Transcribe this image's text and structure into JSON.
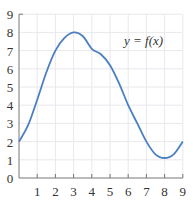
{
  "chart_data": {
    "type": "line",
    "title": "",
    "xlabel": "",
    "ylabel": "",
    "xlim": [
      0,
      9
    ],
    "ylim": [
      0,
      9
    ],
    "grid": true,
    "legend": "none",
    "x_ticks": [
      "1",
      "2",
      "3",
      "4",
      "5",
      "6",
      "7",
      "8",
      "9"
    ],
    "y_ticks": [
      "0",
      "1",
      "2",
      "3",
      "4",
      "5",
      "6",
      "7",
      "8",
      "9"
    ],
    "annotation": "y = f(x)",
    "series": [
      {
        "name": "f(x)",
        "color": "#4a7fc1",
        "x": [
          0,
          0.5,
          1,
          1.5,
          2,
          2.5,
          3,
          3.5,
          4,
          4.5,
          5,
          5.5,
          6,
          6.5,
          7,
          7.5,
          8,
          8.5,
          9
        ],
        "y": [
          2,
          2.9,
          4.3,
          5.8,
          7.0,
          7.7,
          8.0,
          7.8,
          7.1,
          6.8,
          6.2,
          5.2,
          4.0,
          3.0,
          2.0,
          1.3,
          1.1,
          1.3,
          2.0
        ]
      }
    ]
  }
}
